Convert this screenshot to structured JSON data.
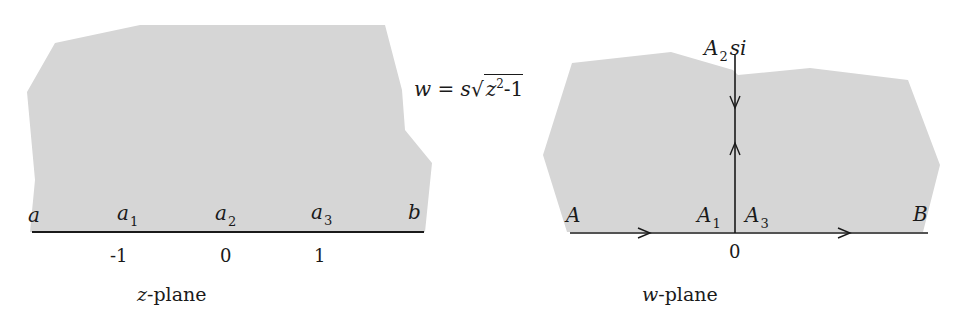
{
  "colors": {
    "region_fill": "#d6d6d6",
    "line": "#1a1a1a",
    "background": "#ffffff"
  },
  "formula": {
    "lhs": "w",
    "eq": "=",
    "coef": "s",
    "radical": "√",
    "radicand_var": "z",
    "radicand_exp": "2",
    "radicand_rest": "-1"
  },
  "z_plane": {
    "caption_var": "z",
    "caption_rest": "-plane",
    "points": [
      {
        "name": "a",
        "sub": ""
      },
      {
        "name": "a",
        "sub": "1"
      },
      {
        "name": "a",
        "sub": "2"
      },
      {
        "name": "a",
        "sub": "3"
      },
      {
        "name": "b",
        "sub": ""
      }
    ],
    "ticks": [
      "-1",
      "0",
      "1"
    ]
  },
  "w_plane": {
    "caption_var": "w",
    "caption_rest": "-plane",
    "top_label": {
      "name": "A",
      "sub": "2",
      "value": "si"
    },
    "points": [
      {
        "name": "A",
        "sub": ""
      },
      {
        "name": "A",
        "sub": "1"
      },
      {
        "name": "A",
        "sub": "3"
      },
      {
        "name": "B",
        "sub": ""
      }
    ],
    "origin_tick": "0"
  }
}
